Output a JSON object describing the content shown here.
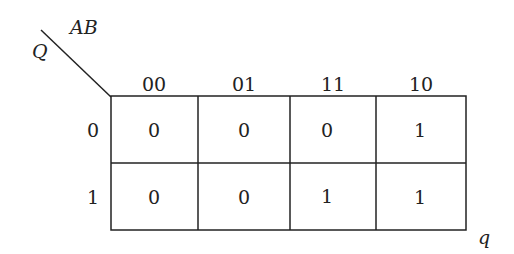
{
  "variables": {
    "column_vars": "AB",
    "row_var": "Q",
    "output": "q"
  },
  "column_headers": [
    "00",
    "01",
    "11",
    "10"
  ],
  "row_headers": [
    "0",
    "1"
  ],
  "cells": [
    [
      "0",
      "0",
      "0",
      "1"
    ],
    [
      "0",
      "0",
      "1",
      "1"
    ]
  ]
}
